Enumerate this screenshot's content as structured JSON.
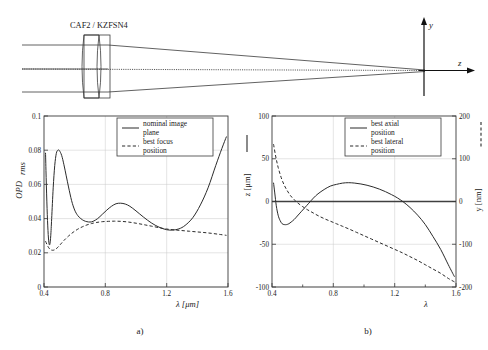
{
  "figure": {
    "subfigure_labels": [
      "a)",
      "b)"
    ],
    "diagram": {
      "lens_label": "CAF2 / KZFSN4",
      "axis_y_label": "y",
      "axis_z_label": "z"
    }
  },
  "chart_data": [
    {
      "type": "line",
      "panel": "a)",
      "title": "",
      "xlabel": "λ  [μm]",
      "ylabel": "OPD",
      "ylabel_sub": "rms",
      "xlim": [
        0.4,
        1.6
      ],
      "ylim": [
        0,
        0.1
      ],
      "xticks": [
        "0.4",
        "0.8",
        "1.2",
        "1.6"
      ],
      "xtick_values": [
        0.4,
        0.8,
        1.2,
        1.6
      ],
      "yticks": [
        "0",
        "0.02",
        "0.04",
        "0.06",
        "0.08",
        "0.1"
      ],
      "ytick_values": [
        0,
        0.02,
        0.04,
        0.06,
        0.08,
        0.1
      ],
      "grid": true,
      "legend_position": "top-center",
      "legend": [
        {
          "label": "nominal image plane",
          "style": "solid"
        },
        {
          "label": "best focus position",
          "style": "dash-dot"
        }
      ],
      "series": [
        {
          "name": "nominal image plane",
          "style": "solid",
          "x": [
            0.41,
            0.414,
            0.42,
            0.426,
            0.432,
            0.438,
            0.444,
            0.45,
            0.46,
            0.47,
            0.48,
            0.49,
            0.5,
            0.515,
            0.53,
            0.545,
            0.56,
            0.58,
            0.6,
            0.62,
            0.64,
            0.66,
            0.68,
            0.7,
            0.72,
            0.75,
            0.78,
            0.81,
            0.84,
            0.87,
            0.9,
            0.93,
            0.96,
            1.0,
            1.05,
            1.1,
            1.15,
            1.2,
            1.24,
            1.28,
            1.32,
            1.37,
            1.42,
            1.47,
            1.52,
            1.56,
            1.59
          ],
          "y": [
            0.0785,
            0.064,
            0.046,
            0.033,
            0.0258,
            0.025,
            0.03,
            0.04,
            0.058,
            0.071,
            0.078,
            0.08,
            0.0798,
            0.077,
            0.0715,
            0.065,
            0.0585,
            0.0505,
            0.045,
            0.0418,
            0.04,
            0.0388,
            0.0382,
            0.038,
            0.0384,
            0.04,
            0.0425,
            0.045,
            0.0472,
            0.0487,
            0.049,
            0.0485,
            0.0472,
            0.0445,
            0.0408,
            0.0375,
            0.035,
            0.0335,
            0.0333,
            0.034,
            0.036,
            0.0405,
            0.048,
            0.058,
            0.071,
            0.081,
            0.088
          ]
        },
        {
          "name": "best focus position",
          "style": "dash-dot",
          "x": [
            0.41,
            0.425,
            0.44,
            0.455,
            0.47,
            0.49,
            0.51,
            0.53,
            0.56,
            0.59,
            0.62,
            0.65,
            0.68,
            0.71,
            0.74,
            0.78,
            0.82,
            0.86,
            0.9,
            0.94,
            0.98,
            1.02,
            1.06,
            1.1,
            1.15,
            1.2,
            1.25,
            1.3,
            1.35,
            1.4,
            1.45,
            1.5,
            1.55,
            1.59
          ],
          "y": [
            0.0268,
            0.0238,
            0.022,
            0.0215,
            0.0218,
            0.0232,
            0.0252,
            0.0272,
            0.0298,
            0.032,
            0.0338,
            0.0352,
            0.0363,
            0.0371,
            0.0377,
            0.0382,
            0.0384,
            0.0385,
            0.0384,
            0.0381,
            0.0376,
            0.037,
            0.0363,
            0.0356,
            0.0347,
            0.0339,
            0.0334,
            0.033,
            0.0326,
            0.0322,
            0.0318,
            0.0313,
            0.0307,
            0.0302
          ]
        }
      ]
    },
    {
      "type": "line",
      "panel": "b)",
      "title": "",
      "xlabel": "λ",
      "ylabel_left": "z  [μm]",
      "ylabel_right": "y  [nm]",
      "xlim": [
        0.4,
        1.6
      ],
      "ylim_left": [
        -100,
        100
      ],
      "ylim_right": [
        -200,
        200
      ],
      "xticks": [
        "0.4",
        "0.8",
        "1.2",
        "1.6"
      ],
      "xtick_values": [
        0.4,
        0.8,
        1.2,
        1.6
      ],
      "yticks_left": [
        "-100",
        "-50",
        "0",
        "50",
        "100"
      ],
      "ytick_left_values": [
        -100,
        -50,
        0,
        50,
        100
      ],
      "yticks_right": [
        "-200",
        "-100",
        "0",
        "100",
        "200"
      ],
      "ytick_right_values": [
        -200,
        -100,
        0,
        100,
        200
      ],
      "grid": true,
      "legend_position": "top-right",
      "legend": [
        {
          "label": "best axial position",
          "style": "solid"
        },
        {
          "label": "best lateral position",
          "style": "dash-dot"
        }
      ],
      "series": [
        {
          "name": "best axial position",
          "style": "solid",
          "axis": "left",
          "x": [
            0.41,
            0.418,
            0.428,
            0.44,
            0.452,
            0.466,
            0.48,
            0.495,
            0.51,
            0.525,
            0.545,
            0.565,
            0.59,
            0.615,
            0.64,
            0.67,
            0.7,
            0.74,
            0.78,
            0.82,
            0.86,
            0.9,
            0.94,
            0.98,
            1.02,
            1.06,
            1.1,
            1.14,
            1.18,
            1.22,
            1.26,
            1.3,
            1.35,
            1.4,
            1.45,
            1.5,
            1.55,
            1.59
          ],
          "y": [
            22,
            10,
            -5,
            -16,
            -22,
            -26,
            -27,
            -27,
            -26,
            -24,
            -21,
            -17,
            -12,
            -7,
            -2,
            4,
            9,
            14,
            18,
            20,
            21.5,
            22,
            21.5,
            20.5,
            19,
            17,
            14.5,
            11.5,
            8,
            4,
            -1,
            -7,
            -16,
            -27,
            -41,
            -56,
            -74,
            -88
          ]
        },
        {
          "name": "best lateral position",
          "style": "dash-dot",
          "axis": "right",
          "x": [
            0.41,
            0.425,
            0.44,
            0.46,
            0.48,
            0.5,
            0.52,
            0.545,
            0.57,
            0.6,
            0.63,
            0.66,
            0.7,
            0.74,
            0.78,
            0.82,
            0.86,
            0.9,
            0.95,
            1.0,
            1.05,
            1.1,
            1.15,
            1.2,
            1.25,
            1.3,
            1.35,
            1.4,
            1.45,
            1.5,
            1.55,
            1.59
          ],
          "y": [
            134,
            104,
            80,
            56,
            38,
            25,
            14,
            4,
            -4,
            -12,
            -19,
            -25,
            -33,
            -40,
            -46,
            -52,
            -58,
            -64,
            -72,
            -80,
            -88,
            -96,
            -104,
            -112,
            -120,
            -129,
            -138,
            -148,
            -158,
            -168,
            -180,
            -188
          ]
        }
      ]
    }
  ]
}
